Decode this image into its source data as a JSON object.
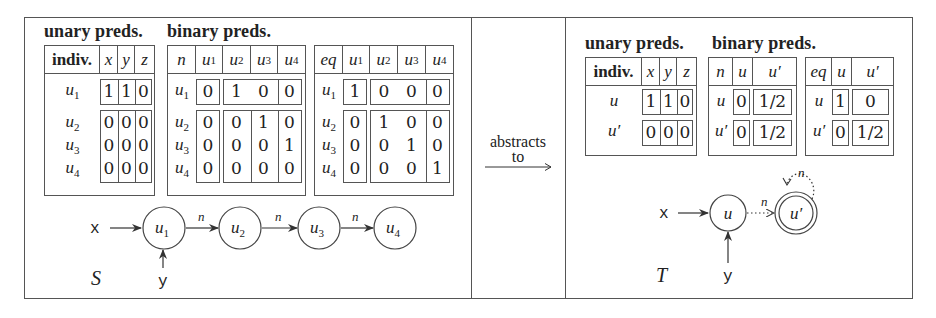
{
  "left_panel": {
    "heading_unary": "unary preds.",
    "heading_binary": "binary preds.",
    "unary_table": {
      "corner": "indiv.",
      "columns": [
        "x",
        "y",
        "z"
      ],
      "rows": [
        {
          "label": "u",
          "sub": "1",
          "values": [
            "1",
            "1",
            "0"
          ]
        },
        {
          "label": "u",
          "sub": "2",
          "values": [
            "0",
            "0",
            "0"
          ]
        },
        {
          "label": "u",
          "sub": "3",
          "values": [
            "0",
            "0",
            "0"
          ]
        },
        {
          "label": "u",
          "sub": "4",
          "values": [
            "0",
            "0",
            "0"
          ]
        }
      ]
    },
    "n_table": {
      "corner": "n",
      "columns": [
        {
          "label": "u",
          "sub": "1"
        },
        {
          "label": "u",
          "sub": "2"
        },
        {
          "label": "u",
          "sub": "3"
        },
        {
          "label": "u",
          "sub": "4"
        }
      ],
      "rows": [
        {
          "label": "u",
          "sub": "1",
          "values": [
            "0",
            "1",
            "0",
            "0"
          ]
        },
        {
          "label": "u",
          "sub": "2",
          "values": [
            "0",
            "0",
            "1",
            "0"
          ]
        },
        {
          "label": "u",
          "sub": "3",
          "values": [
            "0",
            "0",
            "0",
            "1"
          ]
        },
        {
          "label": "u",
          "sub": "4",
          "values": [
            "0",
            "0",
            "0",
            "0"
          ]
        }
      ]
    },
    "eq_table": {
      "corner": "eq",
      "columns": [
        {
          "label": "u",
          "sub": "1"
        },
        {
          "label": "u",
          "sub": "2"
        },
        {
          "label": "u",
          "sub": "3"
        },
        {
          "label": "u",
          "sub": "4"
        }
      ],
      "rows": [
        {
          "label": "u",
          "sub": "1",
          "values": [
            "1",
            "0",
            "0",
            "0"
          ]
        },
        {
          "label": "u",
          "sub": "2",
          "values": [
            "0",
            "1",
            "0",
            "0"
          ]
        },
        {
          "label": "u",
          "sub": "3",
          "values": [
            "0",
            "0",
            "1",
            "0"
          ]
        },
        {
          "label": "u",
          "sub": "4",
          "values": [
            "0",
            "0",
            "0",
            "1"
          ]
        }
      ]
    },
    "graph": {
      "structure_label": "S",
      "var_x": "x",
      "var_y": "y",
      "edge_label": "n",
      "nodes": [
        {
          "label": "u",
          "sub": "1"
        },
        {
          "label": "u",
          "sub": "2"
        },
        {
          "label": "u",
          "sub": "3"
        },
        {
          "label": "u",
          "sub": "4"
        }
      ]
    }
  },
  "middle_panel": {
    "line1": "abstracts",
    "line2": "to"
  },
  "right_panel": {
    "heading_unary": "unary preds.",
    "heading_binary": "binary preds.",
    "unary_table": {
      "corner": "indiv.",
      "columns": [
        "x",
        "y",
        "z"
      ],
      "rows": [
        {
          "label": "u",
          "values": [
            "1",
            "1",
            "0"
          ]
        },
        {
          "label": "u′",
          "values": [
            "0",
            "0",
            "0"
          ]
        }
      ]
    },
    "n_table": {
      "corner": "n",
      "columns": [
        "u",
        "u′"
      ],
      "rows": [
        {
          "label": "u",
          "values": [
            "0",
            "1/2"
          ]
        },
        {
          "label": "u′",
          "values": [
            "0",
            "1/2"
          ]
        }
      ]
    },
    "eq_table": {
      "corner": "eq",
      "columns": [
        "u",
        "u′"
      ],
      "rows": [
        {
          "label": "u",
          "values": [
            "1",
            "0"
          ]
        },
        {
          "label": "u′",
          "values": [
            "0",
            "1/2"
          ]
        }
      ]
    },
    "graph": {
      "structure_label": "T",
      "var_x": "x",
      "var_y": "y",
      "edge_label": "n",
      "self_loop_label": "n",
      "nodes": [
        {
          "label": "u",
          "summary": false
        },
        {
          "label": "u′",
          "summary": true
        }
      ]
    }
  }
}
